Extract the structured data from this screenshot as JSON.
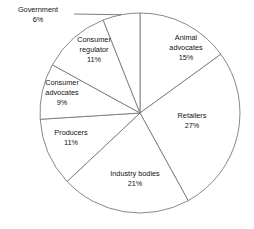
{
  "chart_data": {
    "type": "pie",
    "title": "",
    "subtitle": "",
    "xlabel": "",
    "ylabel": "",
    "legend_position": "none",
    "grid": false,
    "units": "percent",
    "total": 100,
    "start_angle_deg": 0,
    "direction": "clockwise",
    "categories": [
      "Animal advocates",
      "Retailers",
      "Industry bodies",
      "Producers",
      "Consumer advocates",
      "Consumer regulator",
      "Government"
    ],
    "values": [
      15,
      27,
      21,
      11,
      9,
      11,
      6
    ],
    "slices": [
      {
        "label": "Animal advocates",
        "label_line1": "Animal",
        "label_line2": "advocates",
        "value": 15,
        "pct_text": "15%",
        "color": "#ffffff",
        "stroke": "#7a7a7a",
        "label_placement": "inside",
        "label_x": 186,
        "label_y": 48
      },
      {
        "label": "Retailers",
        "label_line1": "Retailers",
        "label_line2": "",
        "value": 27,
        "pct_text": "27%",
        "color": "#ffffff",
        "stroke": "#7a7a7a",
        "label_placement": "inside",
        "label_x": 192,
        "label_y": 121
      },
      {
        "label": "Industry bodies",
        "label_line1": "Industry bodies",
        "label_line2": "",
        "value": 21,
        "pct_text": "21%",
        "color": "#ffffff",
        "stroke": "#7a7a7a",
        "label_placement": "inside",
        "label_x": 135,
        "label_y": 179
      },
      {
        "label": "Producers",
        "label_line1": "Producers",
        "label_line2": "",
        "value": 11,
        "pct_text": "11%",
        "color": "#ffffff",
        "stroke": "#7a7a7a",
        "label_placement": "inside",
        "label_x": 71,
        "label_y": 138
      },
      {
        "label": "Consumer advocates",
        "label_line1": "Consumer",
        "label_line2": "advocates",
        "value": 9,
        "pct_text": "9%",
        "color": "#ffffff",
        "stroke": "#7a7a7a",
        "label_placement": "inside",
        "label_x": 62,
        "label_y": 93
      },
      {
        "label": "Consumer regulator",
        "label_line1": "Consumer",
        "label_line2": "regulator",
        "value": 11,
        "pct_text": "11%",
        "color": "#ffffff",
        "stroke": "#7a7a7a",
        "label_placement": "inside",
        "label_x": 94,
        "label_y": 50
      },
      {
        "label": "Government",
        "label_line1": "Government",
        "label_line2": "",
        "value": 6,
        "pct_text": "6%",
        "color": "#ffffff",
        "stroke": "#7a7a7a",
        "label_placement": "outside-leader",
        "label_x": 38,
        "label_y": 15
      }
    ]
  },
  "geometry": {
    "center_x": 140,
    "center_y": 113,
    "radius": 100
  }
}
